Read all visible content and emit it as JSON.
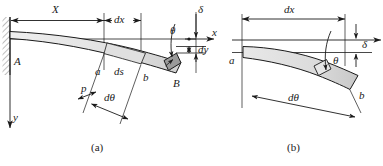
{
  "figure": {
    "title": "",
    "panels": [
      {
        "id": "panel-a",
        "caption": "(a)",
        "labels": {
          "span_X": "X",
          "dx": "dx",
          "theta": "θ",
          "delta": "δ",
          "axis_x": "x",
          "axis_y": "y",
          "dy": "dy",
          "point_A": "A",
          "point_B": "B",
          "point_a": "a",
          "point_b": "b",
          "ds": "ds",
          "rho": "p",
          "dtheta": "dθ"
        }
      },
      {
        "id": "panel-b",
        "caption": "(b)",
        "labels": {
          "dx": "dx",
          "delta": "δ",
          "theta": "θ",
          "point_a": "a",
          "point_b": "b",
          "dtheta": "dθ"
        }
      }
    ],
    "colors": {
      "line": "#1a1a1a",
      "beam_fill_light": "#f0f0f0",
      "beam_fill_mid": "#d9d9d9",
      "beam_fill_dark": "#b0b0b0",
      "hatch": "#808080",
      "background": "#ffffff"
    }
  }
}
